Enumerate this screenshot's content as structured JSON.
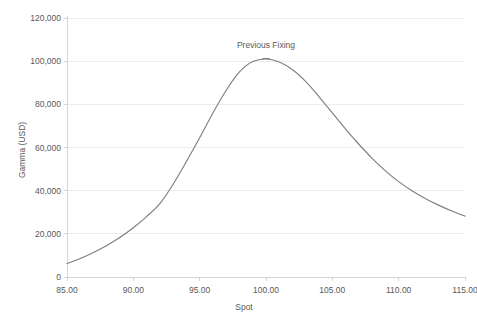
{
  "chart_data": {
    "type": "line",
    "title": "",
    "xlabel": "Spot",
    "ylabel": "Gamma (USD)",
    "xlim": [
      85,
      115
    ],
    "ylim": [
      0,
      120000
    ],
    "grid": "horizontal",
    "legend": "none",
    "x_ticks": [
      "85.00",
      "90.00",
      "95.00",
      "100.00",
      "105.00",
      "110.00",
      "115.00"
    ],
    "x_tick_values": [
      85,
      90,
      95,
      100,
      105,
      110,
      115
    ],
    "y_ticks": [
      "0",
      "20,000",
      "40,000",
      "60,000",
      "80,000",
      "100,000",
      "120,000"
    ],
    "y_tick_values": [
      0,
      20000,
      40000,
      60000,
      80000,
      100000,
      120000
    ],
    "series": [
      {
        "name": "Gamma",
        "color": "#7f7f7f",
        "x": [
          85,
          86,
          87,
          88,
          89,
          90,
          91,
          92,
          93,
          94,
          95,
          96,
          97,
          98,
          99,
          100,
          101,
          102,
          103,
          104,
          105,
          106,
          107,
          108,
          109,
          110,
          111,
          112,
          113,
          114,
          115
        ],
        "values": [
          6200,
          8600,
          11400,
          14600,
          18400,
          22800,
          28000,
          34000,
          43000,
          53500,
          64500,
          76000,
          86500,
          95000,
          99800,
          101000,
          99600,
          96000,
          90500,
          83500,
          76000,
          68500,
          61500,
          55000,
          49200,
          44200,
          40000,
          36400,
          33300,
          30600,
          28200
        ]
      }
    ],
    "annotations": [
      {
        "text": "Previous Fixing",
        "x": 100,
        "y": 101000,
        "marker": "tick"
      }
    ]
  }
}
